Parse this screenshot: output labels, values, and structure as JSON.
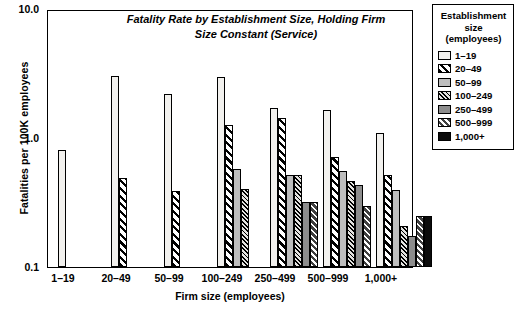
{
  "chart_data": {
    "type": "bar",
    "title": "Fatality Rate by Establishment Size, Holding Firm Size Constant (Service)",
    "title_line1": "Fatality Rate by Establishment Size, Holding Firm",
    "title_line2": "Size Constant (Service)",
    "xlabel": "Firm size (employees)",
    "ylabel": "Fatalities per 100K employees",
    "yscale": "log",
    "ylim": [
      0.1,
      10.0
    ],
    "ytick_labels": [
      "10.0",
      "1.0",
      "0.1"
    ],
    "ytick_values": [
      10.0,
      1.0,
      0.1
    ],
    "grid": false,
    "legend_position": "right-outside",
    "legend_title_lines": [
      "Establishment",
      "size",
      "(employees)"
    ],
    "categories": [
      "1–19",
      "20–49",
      "50–99",
      "100–249",
      "250–499",
      "500–999",
      "1,000+"
    ],
    "series": [
      {
        "name": "1–19",
        "pattern": "light-solid",
        "values": [
          0.82,
          3.1,
          2.25,
          3.05,
          1.75,
          1.7,
          1.12
        ]
      },
      {
        "name": "20–49",
        "pattern": "black-diagonal",
        "values": [
          null,
          0.5,
          0.39,
          1.28,
          1.45,
          0.72,
          0.52
        ]
      },
      {
        "name": "50–99",
        "pattern": "grey-solid",
        "values": [
          null,
          null,
          null,
          0.58,
          0.52,
          0.56,
          0.4
        ]
      },
      {
        "name": "100–249",
        "pattern": "fine-diagonal",
        "values": [
          null,
          null,
          null,
          0.41,
          0.52,
          0.47,
          0.21
        ]
      },
      {
        "name": "250–499",
        "pattern": "dark-grey-solid",
        "values": [
          null,
          null,
          null,
          null,
          0.32,
          0.44,
          0.175
        ]
      },
      {
        "name": "500–999",
        "pattern": "dark-white-diagonal",
        "values": [
          null,
          null,
          null,
          null,
          0.32,
          0.3,
          0.25
        ]
      },
      {
        "name": "1,000+",
        "pattern": "black-solid",
        "values": [
          null,
          null,
          null,
          null,
          null,
          null,
          0.25
        ]
      }
    ]
  },
  "legend": {
    "title_lines": [
      "Establishment",
      "size",
      "(employees)"
    ],
    "items": [
      {
        "label": "1–19"
      },
      {
        "label": "20–49"
      },
      {
        "label": "50–99"
      },
      {
        "label": "100–249"
      },
      {
        "label": "250–499"
      },
      {
        "label": "500–999"
      },
      {
        "label": "1,000+"
      }
    ]
  },
  "axes": {
    "y_title": "Fatalities per 100K employees",
    "x_title": "Firm size (employees)",
    "y_ticks": [
      "10.0",
      "1.0",
      "0.1"
    ],
    "x_ticks": [
      "1–19",
      "20–49",
      "50–99",
      "100–249",
      "250–499",
      "500–999",
      "1,000+"
    ]
  }
}
